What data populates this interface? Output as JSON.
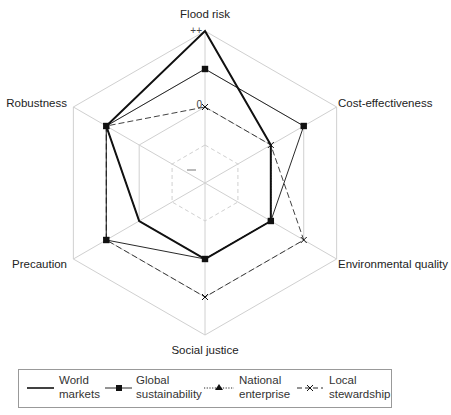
{
  "chart_data": {
    "type": "radar",
    "title": "",
    "axes": [
      "Flood risk",
      "Cost-effectiveness",
      "Environmental quality",
      "Social justice",
      "Precaution",
      "Robustness"
    ],
    "scale_labels": [
      "--",
      "-",
      "0",
      "+",
      "++"
    ],
    "visible_scale_labels": {
      "outer": "++",
      "mid": "0",
      "inner": "–"
    },
    "range": [
      0,
      4
    ],
    "series": [
      {
        "name": "World markets",
        "style": "solid-thick",
        "values": [
          4,
          2,
          2,
          2,
          2,
          3
        ]
      },
      {
        "name": "Global sustainability",
        "style": "solid-square",
        "values": [
          3,
          3,
          2,
          2,
          3,
          3
        ]
      },
      {
        "name": "National enterprise",
        "style": "dotted-triangle",
        "values": [
          4,
          2,
          2,
          2,
          2,
          3
        ]
      },
      {
        "name": "Local stewardship",
        "style": "dash-cross",
        "values": [
          2,
          2,
          3,
          3,
          3,
          3
        ]
      }
    ],
    "legend_position": "bottom"
  },
  "legend": {
    "items": [
      {
        "line1": "World",
        "line2": "markets"
      },
      {
        "line1": "Global",
        "line2": "sustainability"
      },
      {
        "line1": "National",
        "line2": "enterprise"
      },
      {
        "line1": "Local",
        "line2": "stewardship"
      }
    ]
  }
}
